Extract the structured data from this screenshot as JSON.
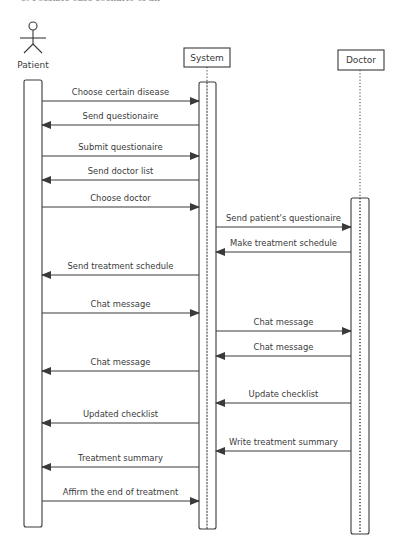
{
  "caption_fragment": "C. Possible case scenario of an",
  "participants": [
    {
      "id": "patient",
      "label": "Patient",
      "kind": "actor",
      "x": 33,
      "bar": {
        "x": 24,
        "w": 18,
        "y1": 80,
        "y2": 527
      }
    },
    {
      "id": "system",
      "label": "System",
      "kind": "box",
      "x": 207,
      "box": {
        "x": 184,
        "y": 48,
        "w": 46,
        "h": 19
      },
      "bar": {
        "x": 199,
        "w": 17,
        "y1": 82,
        "y2": 529
      }
    },
    {
      "id": "doctor",
      "label": "Doctor",
      "kind": "box",
      "x": 360,
      "box": {
        "x": 338,
        "y": 50,
        "w": 46,
        "h": 20
      },
      "bar": {
        "x": 351,
        "w": 18,
        "y1": 198,
        "y2": 534
      }
    }
  ],
  "messages": [
    {
      "from": "patient",
      "to": "system",
      "label": "Choose certain disease",
      "y": 101
    },
    {
      "from": "system",
      "to": "patient",
      "label": "Send questionaire",
      "y": 125
    },
    {
      "from": "patient",
      "to": "system",
      "label": "Submit questionaire",
      "y": 156
    },
    {
      "from": "system",
      "to": "patient",
      "label": "Send doctor list",
      "y": 180
    },
    {
      "from": "patient",
      "to": "system",
      "label": "Choose doctor",
      "y": 207
    },
    {
      "from": "system",
      "to": "doctor",
      "label": "Send patient's questionaire",
      "y": 227
    },
    {
      "from": "doctor",
      "to": "system",
      "label": "Make treatment schedule",
      "y": 252
    },
    {
      "from": "system",
      "to": "patient",
      "label": "Send treatment schedule",
      "y": 275
    },
    {
      "from": "patient",
      "to": "system",
      "label": "Chat message",
      "y": 313
    },
    {
      "from": "system",
      "to": "doctor",
      "label": "Chat message",
      "y": 331
    },
    {
      "from": "doctor",
      "to": "system",
      "label": "Chat message",
      "y": 356
    },
    {
      "from": "system",
      "to": "patient",
      "label": "Chat message",
      "y": 371
    },
    {
      "from": "doctor",
      "to": "system",
      "label": "Update checklist",
      "y": 403
    },
    {
      "from": "system",
      "to": "patient",
      "label": "Updated checklist",
      "y": 423
    },
    {
      "from": "doctor",
      "to": "system",
      "label": "Write treatment summary",
      "y": 451
    },
    {
      "from": "system",
      "to": "patient",
      "label": "Treatment summary",
      "y": 467
    },
    {
      "from": "patient",
      "to": "system",
      "label": "Affirm the end of treatment",
      "y": 501
    }
  ],
  "colors": {
    "line": "#3a3a3a",
    "text": "#3a3a3a",
    "background": "#ffffff"
  }
}
